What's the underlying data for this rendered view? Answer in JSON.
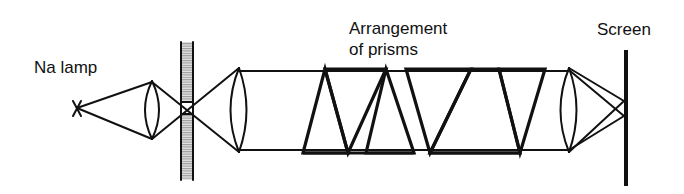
{
  "diagram": {
    "labels": {
      "source": "Na lamp",
      "prisms_line1": "Arrangement",
      "prisms_line2": "of prisms",
      "screen": "Screen"
    },
    "components": [
      {
        "id": "na-lamp",
        "name": "Na lamp (point source)",
        "symbol": "X"
      },
      {
        "id": "condenser-lens",
        "name": "Condenser lens"
      },
      {
        "id": "slit",
        "name": "Slit"
      },
      {
        "id": "collimator-lens",
        "name": "Collimating lens"
      },
      {
        "id": "prism-arrangement",
        "name": "Arrangement of prisms",
        "count": 5
      },
      {
        "id": "focusing-lens",
        "name": "Focusing lens"
      },
      {
        "id": "screen",
        "name": "Screen"
      }
    ],
    "colors": {
      "line": "#111111",
      "prism_fill": "#b8b8b8",
      "slit_fill": "#d0d0d0",
      "background": "#ffffff"
    }
  }
}
